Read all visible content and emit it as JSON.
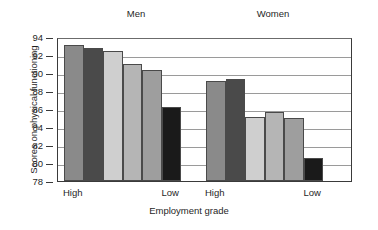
{
  "chart_data": {
    "type": "bar",
    "title": "",
    "xlabel": "Employment grade",
    "ylabel": "Scores on physical functioning",
    "ylim": [
      78,
      94
    ],
    "ytick_values": [
      94,
      92,
      90,
      88,
      86,
      84,
      82,
      80,
      78
    ],
    "grid": true,
    "legend": "none",
    "group_labels": [
      "Men",
      "Women"
    ],
    "category_labels": [
      "High",
      "Low",
      "High",
      "Low"
    ],
    "groups": [
      {
        "name": "Men",
        "x_start_label": "High",
        "x_end_label": "Low",
        "values": [
          93.1,
          92.8,
          92.4,
          91.0,
          90.3,
          86.2
        ],
        "colors": [
          "#8a8a8a",
          "#4a4a4a",
          "#cfcfcf",
          "#b5b5b5",
          "#9e9e9e",
          "#1a1a1a"
        ]
      },
      {
        "name": "Women",
        "x_start_label": "High",
        "x_end_label": "Low",
        "values": [
          89.1,
          89.3,
          85.1,
          85.7,
          85.0,
          80.6
        ],
        "colors": [
          "#8a8a8a",
          "#4a4a4a",
          "#cfcfcf",
          "#b5b5b5",
          "#9e9e9e",
          "#1a1a1a"
        ]
      }
    ]
  },
  "axis": {
    "y_title": "Scores on physical functioning",
    "x_title": "Employment grade"
  },
  "labels": {
    "men": "Men",
    "women": "Women",
    "high_1": "High",
    "low_1": "Low",
    "high_2": "High",
    "low_2": "Low"
  }
}
